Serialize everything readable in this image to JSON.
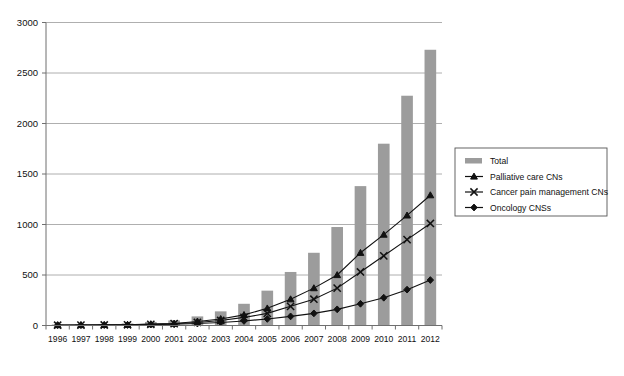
{
  "chart_data": {
    "type": "bar",
    "title": "",
    "subtitle": "",
    "xlabel": "",
    "ylabel": "",
    "ylim": [
      0,
      3000
    ],
    "ytick_step": 500,
    "yticks": [
      "0",
      "500",
      "1000",
      "1500",
      "2000",
      "2500",
      "3000"
    ],
    "grid": true,
    "legend_position": "right",
    "categories": [
      "1996",
      "1997",
      "1998",
      "1999",
      "2000",
      "2001",
      "2002",
      "2003",
      "2004",
      "2005",
      "2006",
      "2007",
      "2008",
      "2009",
      "2010",
      "2011",
      "2012"
    ],
    "series": [
      {
        "name": "Total",
        "render": "bar",
        "color": "#9c9c9c",
        "marker": "bar",
        "values": [
          10,
          12,
          15,
          20,
          35,
          50,
          90,
          140,
          215,
          345,
          530,
          720,
          975,
          1380,
          1800,
          2275,
          2730
        ]
      },
      {
        "name": "Palliative care CNs",
        "render": "line",
        "color": "#111111",
        "marker": "triangle",
        "values": [
          4,
          5,
          6,
          8,
          14,
          20,
          40,
          65,
          105,
          170,
          260,
          370,
          500,
          720,
          900,
          1090,
          1290
        ]
      },
      {
        "name": "Cancer pain management CNs",
        "render": "line",
        "color": "#111111",
        "marker": "cross",
        "values": [
          3,
          4,
          5,
          7,
          12,
          18,
          30,
          50,
          80,
          120,
          190,
          260,
          370,
          530,
          690,
          850,
          1010
        ]
      },
      {
        "name": "Oncology CNSs",
        "render": "line",
        "color": "#111111",
        "marker": "diamond",
        "values": [
          3,
          3,
          4,
          5,
          9,
          12,
          20,
          30,
          45,
          65,
          90,
          120,
          160,
          215,
          275,
          355,
          450
        ]
      }
    ]
  },
  "legend": {
    "items": [
      {
        "label": "Total",
        "marker": "bar"
      },
      {
        "label": "Palliative care CNs",
        "marker": "triangle"
      },
      {
        "label": "Cancer pain management CNs",
        "marker": "cross"
      },
      {
        "label": "Oncology CNSs",
        "marker": "diamond"
      }
    ]
  }
}
